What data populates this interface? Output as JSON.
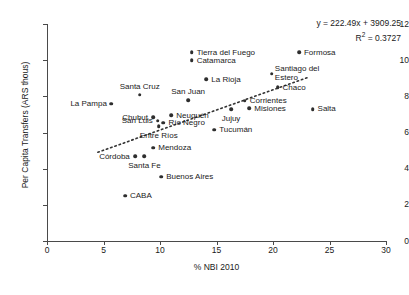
{
  "chart_data": {
    "type": "scatter",
    "title": "",
    "xlabel": "% NBI 2010",
    "ylabel": "Per Capita Transfers (ARS thous)",
    "xlim": [
      0,
      30
    ],
    "ylim": [
      0,
      12
    ],
    "xticks": [
      0,
      5,
      10,
      15,
      20,
      25,
      30
    ],
    "yticks": [
      0,
      2,
      4,
      6,
      8,
      10,
      12
    ],
    "grid": false,
    "legend": "none",
    "annotations": {
      "equation": "y = 222.49x + 3909.25",
      "r_squared_prefix": "R",
      "r_squared_sup": "2",
      "r_squared_value": " = 0.3727"
    },
    "trendline": {
      "type": "dotted-linear",
      "slope_per_thousand": 0.22249,
      "intercept_thousand": 3.90925,
      "x_start": 4.5,
      "x_end": 23.2
    },
    "points": [
      {
        "label": "Tierra del Fuego",
        "x": 12.8,
        "y": 10.45,
        "label_pos": "right"
      },
      {
        "label": "Catamarca",
        "x": 12.8,
        "y": 10.0,
        "label_pos": "right"
      },
      {
        "label": "Formosa",
        "x": 22.3,
        "y": 10.45,
        "label_pos": "right"
      },
      {
        "label": "Santiago del Estero",
        "x": 19.9,
        "y": 9.25,
        "label_pos": "two-line-right"
      },
      {
        "label": "La Rioja",
        "x": 14.1,
        "y": 8.95,
        "label_pos": "right"
      },
      {
        "label": "Chaco",
        "x": 20.4,
        "y": 8.5,
        "label_pos": "right"
      },
      {
        "label": "Santa Cruz",
        "x": 8.2,
        "y": 8.1,
        "label_pos": "above"
      },
      {
        "label": "San Juan",
        "x": 12.5,
        "y": 7.8,
        "label_pos": "above"
      },
      {
        "label": "Corrientes",
        "x": 17.5,
        "y": 7.75,
        "label_pos": "right"
      },
      {
        "label": "La Pampa",
        "x": 5.7,
        "y": 7.6,
        "label_pos": "left"
      },
      {
        "label": "Misiones",
        "x": 17.9,
        "y": 7.35,
        "label_pos": "right"
      },
      {
        "label": "Salta",
        "x": 23.5,
        "y": 7.3,
        "label_pos": "right"
      },
      {
        "label": "Jujuy",
        "x": 16.3,
        "y": 7.3,
        "label_pos": "below"
      },
      {
        "label": "Neuquén",
        "x": 11.0,
        "y": 6.95,
        "label_pos": "right"
      },
      {
        "label": "Chubut",
        "x": 9.4,
        "y": 6.85,
        "label_pos": "left"
      },
      {
        "label": "San Luis",
        "x": 9.8,
        "y": 6.65,
        "label_pos": "left"
      },
      {
        "label": "Río Negro",
        "x": 10.3,
        "y": 6.55,
        "label_pos": "right"
      },
      {
        "label": "Entre Ríos",
        "x": 9.9,
        "y": 6.35,
        "label_pos": "below"
      },
      {
        "label": "Tucumán",
        "x": 14.8,
        "y": 6.15,
        "label_pos": "right"
      },
      {
        "label": "Mendoza",
        "x": 9.4,
        "y": 5.15,
        "label_pos": "right"
      },
      {
        "label": "Córdoba",
        "x": 7.8,
        "y": 4.7,
        "label_pos": "left"
      },
      {
        "label": "Santa Fe",
        "x": 8.6,
        "y": 4.7,
        "label_pos": "below"
      },
      {
        "label": "Buenos Aires",
        "x": 10.1,
        "y": 3.55,
        "label_pos": "right"
      },
      {
        "label": "CABA",
        "x": 6.9,
        "y": 2.5,
        "label_pos": "right"
      }
    ]
  }
}
